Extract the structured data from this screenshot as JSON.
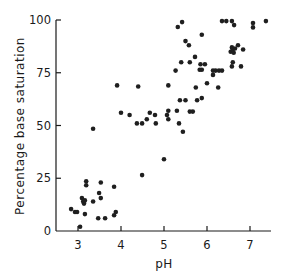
{
  "chart_data": {
    "type": "scatter",
    "title": "",
    "xlabel": "pH",
    "ylabel": "Percentage base saturation",
    "xlim": [
      2.5,
      7.6
    ],
    "ylim": [
      0,
      100
    ],
    "xticks": [
      3,
      4,
      5,
      6,
      7
    ],
    "yticks": [
      0,
      25,
      50,
      75,
      100
    ],
    "xtick_labels": [
      "3",
      "4",
      "5",
      "6",
      "7"
    ],
    "ytick_labels": [
      "0",
      "25",
      "50",
      "75",
      "100"
    ],
    "grid": false,
    "legend": null,
    "point_color": "#1f1f1f",
    "series": [
      {
        "name": "samples",
        "points": [
          [
            3.05,
            2
          ],
          [
            2.84,
            10.4
          ],
          [
            2.93,
            9
          ],
          [
            2.98,
            9
          ],
          [
            3.16,
            8
          ],
          [
            3.09,
            15.6
          ],
          [
            3.12,
            14
          ],
          [
            3.14,
            13
          ],
          [
            3.16,
            14.5
          ],
          [
            3.19,
            23.6
          ],
          [
            3.19,
            21.7
          ],
          [
            3.35,
            14
          ],
          [
            3.49,
            18
          ],
          [
            3.53,
            15.6
          ],
          [
            3.53,
            23
          ],
          [
            3.47,
            6
          ],
          [
            3.63,
            6
          ],
          [
            3.84,
            7.5
          ],
          [
            3.88,
            9
          ],
          [
            3.84,
            21
          ],
          [
            3.35,
            48.5
          ],
          [
            4.49,
            26.5
          ],
          [
            5.0,
            34
          ],
          [
            3.91,
            69
          ],
          [
            4.4,
            68.5
          ],
          [
            5.1,
            69
          ],
          [
            4.0,
            56
          ],
          [
            4.2,
            55
          ],
          [
            4.37,
            51
          ],
          [
            4.49,
            51
          ],
          [
            4.6,
            53
          ],
          [
            4.67,
            56
          ],
          [
            4.79,
            55
          ],
          [
            4.81,
            51
          ],
          [
            5.07,
            55
          ],
          [
            5.1,
            57
          ],
          [
            5.1,
            53
          ],
          [
            5.3,
            57
          ],
          [
            5.35,
            51
          ],
          [
            5.44,
            47
          ],
          [
            5.6,
            56.6
          ],
          [
            5.67,
            56.6
          ],
          [
            5.37,
            62
          ],
          [
            5.5,
            62
          ],
          [
            5.77,
            62
          ],
          [
            5.88,
            63
          ],
          [
            5.74,
            68
          ],
          [
            6.0,
            70
          ],
          [
            6.26,
            68
          ],
          [
            5.27,
            76
          ],
          [
            5.83,
            76.4
          ],
          [
            5.88,
            76.4
          ],
          [
            6.14,
            76
          ],
          [
            6.2,
            76
          ],
          [
            6.28,
            76
          ],
          [
            6.35,
            76
          ],
          [
            6.14,
            74
          ],
          [
            5.4,
            80
          ],
          [
            5.6,
            80
          ],
          [
            5.85,
            79
          ],
          [
            5.95,
            79
          ],
          [
            5.72,
            82.5
          ],
          [
            6.6,
            80
          ],
          [
            6.58,
            78
          ],
          [
            6.79,
            78
          ],
          [
            6.55,
            85
          ],
          [
            6.58,
            87
          ],
          [
            6.6,
            86
          ],
          [
            6.62,
            84.5
          ],
          [
            6.65,
            86.5
          ],
          [
            6.72,
            88
          ],
          [
            6.84,
            86
          ],
          [
            5.5,
            90
          ],
          [
            5.58,
            88
          ],
          [
            5.88,
            93
          ],
          [
            5.32,
            96.7
          ],
          [
            5.42,
            99
          ],
          [
            6.35,
            99.5
          ],
          [
            6.45,
            99.5
          ],
          [
            6.58,
            99.5
          ],
          [
            6.63,
            97.6
          ],
          [
            7.07,
            98.6
          ],
          [
            7.07,
            96.5
          ],
          [
            7.37,
            99.5
          ]
        ]
      }
    ]
  }
}
